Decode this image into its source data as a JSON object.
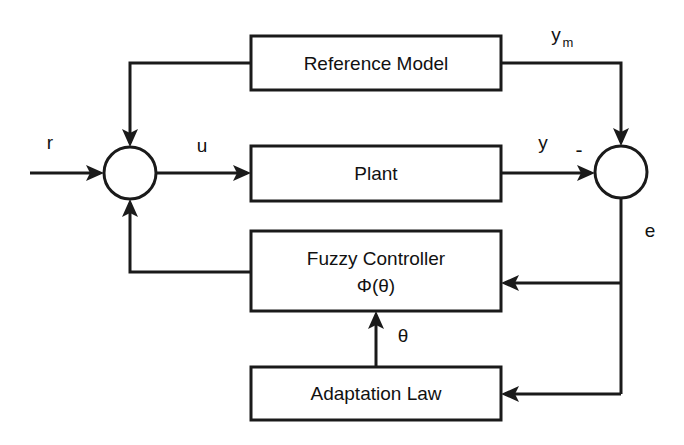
{
  "diagram": {
    "type": "control-block-diagram",
    "colors": {
      "background": "#ffffff",
      "line": "#1a1a1a",
      "text": "#111111",
      "box_fill": "#ffffff"
    },
    "blocks": [
      {
        "id": "reference-model",
        "label": "Reference Model",
        "label2": "",
        "x": 251,
        "y": 36,
        "width": 250,
        "height": 54
      },
      {
        "id": "plant",
        "label": "Plant",
        "label2": "",
        "x": 251,
        "y": 146,
        "width": 250,
        "height": 55
      },
      {
        "id": "fuzzy-controller",
        "label": "Fuzzy Controller",
        "label2": "Φ(θ)",
        "x": 251,
        "y": 231,
        "width": 250,
        "height": 80
      },
      {
        "id": "adaptation-law",
        "label": "Adaptation Law",
        "label2": "",
        "x": 251,
        "y": 367,
        "width": 250,
        "height": 53
      }
    ],
    "junctions": [
      {
        "id": "summing-junction-left",
        "cx": 130,
        "cy": 173,
        "r": 26
      },
      {
        "id": "summing-junction-right",
        "cx": 621,
        "cy": 172,
        "r": 26
      }
    ],
    "signals": [
      {
        "id": "r",
        "label": "r",
        "sub": "",
        "x": 50,
        "y": 144
      },
      {
        "id": "u",
        "label": "u",
        "sub": "",
        "x": 202,
        "y": 147
      },
      {
        "id": "y",
        "label": "y",
        "sub": "",
        "x": 543,
        "y": 144
      },
      {
        "id": "ym",
        "label": "y",
        "sub": "m",
        "x": 556,
        "y": 36
      },
      {
        "id": "minus",
        "label": "-",
        "sub": "",
        "x": 579,
        "y": 151
      },
      {
        "id": "e",
        "label": "e",
        "sub": "",
        "x": 650,
        "y": 232
      },
      {
        "id": "theta",
        "label": "θ",
        "sub": "",
        "x": 403,
        "y": 337
      }
    ],
    "connections": [
      {
        "id": "input-r-to-sum",
        "from": "r-input",
        "to": "summing-junction-left"
      },
      {
        "id": "sum-to-plant",
        "from": "summing-junction-left",
        "to": "plant",
        "signal": "u"
      },
      {
        "id": "plant-to-sum-right",
        "from": "plant",
        "to": "summing-junction-right",
        "signal": "y"
      },
      {
        "id": "refmodel-to-sum-right",
        "from": "reference-model",
        "to": "summing-junction-right",
        "signal": "y_m"
      },
      {
        "id": "refmodel-to-sum-left",
        "from": "reference-model",
        "to": "summing-junction-left"
      },
      {
        "id": "fuzzy-to-sum-left",
        "from": "fuzzy-controller",
        "to": "summing-junction-left"
      },
      {
        "id": "error-to-fuzzy",
        "from": "summing-junction-right",
        "to": "fuzzy-controller",
        "signal": "e"
      },
      {
        "id": "error-to-adaptation",
        "from": "summing-junction-right",
        "to": "adaptation-law",
        "signal": "e"
      },
      {
        "id": "adaptation-to-fuzzy",
        "from": "adaptation-law",
        "to": "fuzzy-controller",
        "signal": "theta"
      }
    ]
  }
}
